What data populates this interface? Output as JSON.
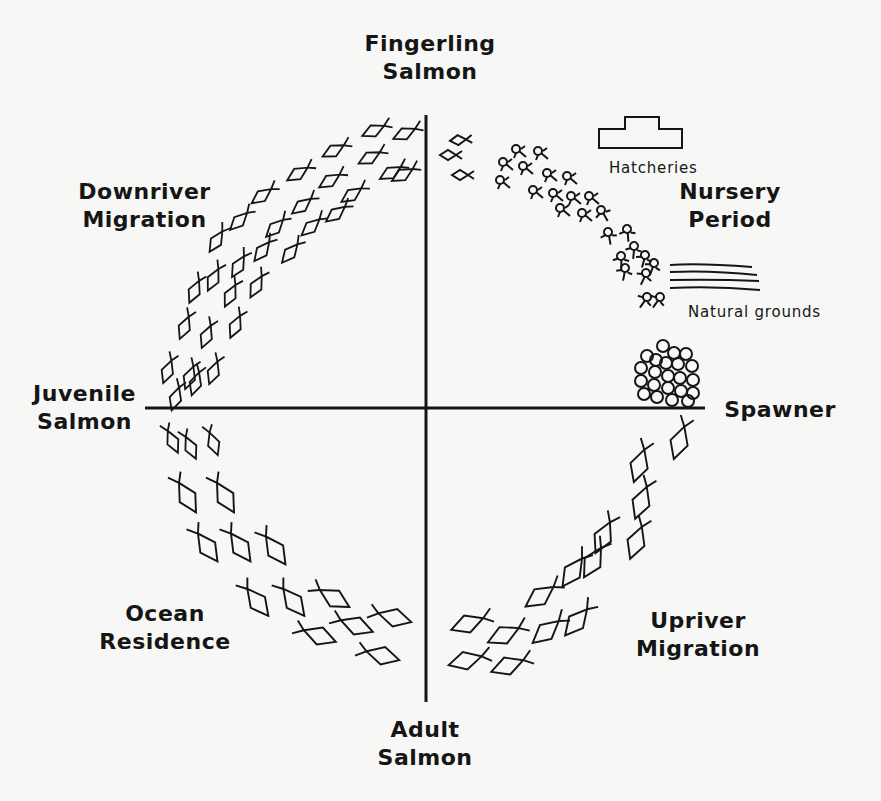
{
  "diagram": {
    "stages": {
      "fingerling": {
        "line1": "Fingerling",
        "line2": "Salmon"
      },
      "nursery": {
        "line1": "Nursery",
        "line2": "Period"
      },
      "spawner": {
        "line1": "Spawner"
      },
      "upriver": {
        "line1": "Upriver",
        "line2": "Migration"
      },
      "adult": {
        "line1": "Adult",
        "line2": "Salmon"
      },
      "ocean": {
        "line1": "Ocean",
        "line2": "Residence"
      },
      "juvenile": {
        "line1": "Juvenile",
        "line2": "Salmon"
      },
      "downriver": {
        "line1": "Downriver",
        "line2": "Migration"
      }
    },
    "annotations": {
      "hatcheries": "Hatcheries",
      "natural_grounds": "Natural grounds"
    },
    "icons": [
      "hatchery-building-icon",
      "natural-grounds-water-icon",
      "eggs-cluster-icon",
      "fish-icon"
    ],
    "colors": {
      "ink": "#151515",
      "paper": "#f7f7f5"
    }
  }
}
